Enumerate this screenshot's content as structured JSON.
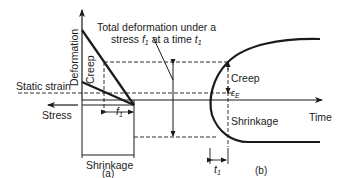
{
  "diagram": {
    "type": "deformation-time diagram",
    "panel_a": {
      "caption": "(a)",
      "axis_vertical_label": "Deformation",
      "axis_horizontal_left_label": "Stress",
      "labels": {
        "creep": "Creep",
        "static_strain": "Static strain",
        "shrinkage": "Shrinkage",
        "f1": "f",
        "f1_sub": "1"
      },
      "annotation": {
        "line1": "Total deformation under a",
        "line2_prefix": "stress ",
        "line2_f": "f",
        "line2_f_sub": "1",
        "line2_mid": " at a time ",
        "line2_t": "t",
        "line2_t_sub": "1"
      }
    },
    "panel_b": {
      "caption": "(b)",
      "axis_horizontal_label": "Time",
      "labels": {
        "creep": "Creep",
        "elastic": "ε",
        "elastic_sub": "E",
        "shrinkage": "Shrinkage",
        "t1": "t",
        "t1_sub": "1"
      }
    },
    "colors": {
      "line": "#1a1a1a",
      "dashed": "#333333",
      "background": "#ffffff"
    }
  }
}
